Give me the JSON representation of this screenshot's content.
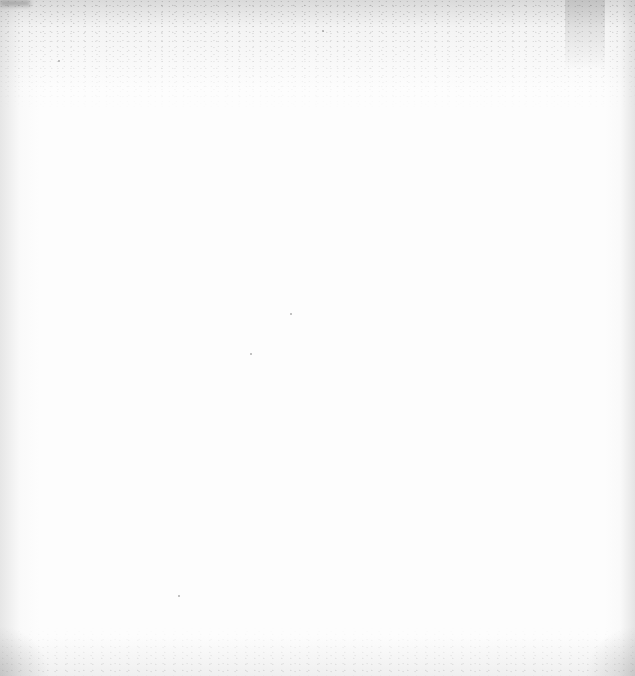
{
  "page": {
    "kind": "blank-scanned-page",
    "background_color": "#fdfdfd",
    "noise_color": "#888888"
  }
}
